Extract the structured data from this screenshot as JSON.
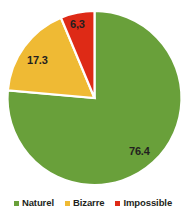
{
  "chart_data": {
    "type": "pie",
    "title": "",
    "subtitle": "",
    "xlabel": "",
    "ylabel": "",
    "grid": false,
    "legend_position": "bottom",
    "start_angle_deg": 0,
    "direction": "clockwise",
    "categories": [
      "Naturel",
      "Bizarre",
      "Impossible"
    ],
    "values": [
      76.4,
      17.3,
      6.3
    ],
    "data_labels": [
      "76.4",
      "17.3",
      "6,3"
    ],
    "colors": [
      "#69a03a",
      "#efba34",
      "#de2a16"
    ],
    "slices": [
      {
        "name": "Naturel",
        "value": 76.4,
        "label": "76.4",
        "color": "#69a03a",
        "start_deg": 0,
        "end_deg": 275.04
      },
      {
        "name": "Bizarre",
        "value": 17.3,
        "label": "17.3",
        "color": "#efba34",
        "start_deg": 275.04,
        "end_deg": 337.32
      },
      {
        "name": "Impossible",
        "value": 6.3,
        "label": "6,3",
        "color": "#de2a16",
        "start_deg": 337.32,
        "end_deg": 360
      }
    ]
  },
  "legend": {
    "items": [
      {
        "label": "Naturel",
        "color": "#69a03a"
      },
      {
        "label": "Bizarre",
        "color": "#efba34"
      },
      {
        "label": "Impossible",
        "color": "#de2a16"
      }
    ]
  },
  "labels": {
    "naturel": "76.4",
    "bizarre": "17.3",
    "impossible": "6,3"
  },
  "colors": {
    "naturel": "#69a03a",
    "bizarre": "#efba34",
    "impossible": "#de2a16",
    "separator": "#ffffff",
    "text": "#231f20",
    "background": "#ffffff"
  }
}
